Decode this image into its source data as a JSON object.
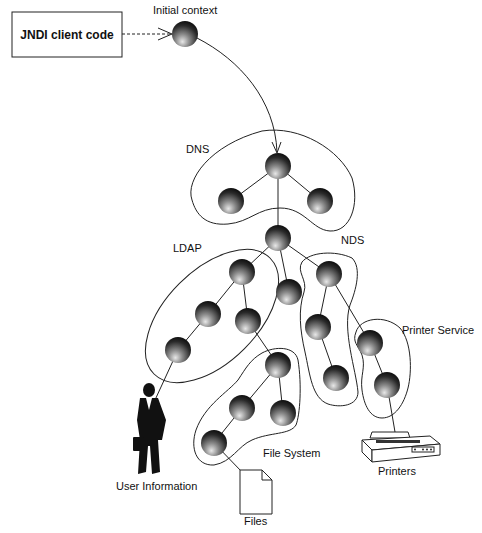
{
  "diagram": {
    "client_box": {
      "label": "JNDI client code"
    },
    "initial_context": {
      "label": "Initial context"
    },
    "namespaces": [
      {
        "id": "dns",
        "label": "DNS"
      },
      {
        "id": "ldap",
        "label": "LDAP"
      },
      {
        "id": "nds",
        "label": "NDS"
      },
      {
        "id": "printer-service",
        "label": "Printer Service"
      },
      {
        "id": "file-system",
        "label": "File System"
      }
    ],
    "resources": [
      {
        "id": "user-information",
        "label": "User Information",
        "icon": "person-icon"
      },
      {
        "id": "files",
        "label": "Files",
        "icon": "document-icon"
      },
      {
        "id": "printers",
        "label": "Printers",
        "icon": "printer-icon"
      }
    ],
    "nodes": [
      {
        "id": "ic",
        "x": 185,
        "y": 34
      },
      {
        "id": "dns-top",
        "x": 278,
        "y": 166
      },
      {
        "id": "dns-left",
        "x": 231,
        "y": 201
      },
      {
        "id": "dns-right",
        "x": 320,
        "y": 201
      },
      {
        "id": "root",
        "x": 278,
        "y": 238
      },
      {
        "id": "ldap-top",
        "x": 242,
        "y": 272
      },
      {
        "id": "ldap-midleft",
        "x": 208,
        "y": 314
      },
      {
        "id": "ldap-midright",
        "x": 248,
        "y": 321
      },
      {
        "id": "ldap-bottom",
        "x": 178,
        "y": 350
      },
      {
        "id": "mid",
        "x": 289,
        "y": 292
      },
      {
        "id": "nds-top",
        "x": 329,
        "y": 274
      },
      {
        "id": "nds-mid",
        "x": 318,
        "y": 327
      },
      {
        "id": "nds-bottom",
        "x": 336,
        "y": 378
      },
      {
        "id": "ps-top",
        "x": 370,
        "y": 343
      },
      {
        "id": "ps-bottom",
        "x": 387,
        "y": 385
      },
      {
        "id": "fs-top",
        "x": 278,
        "y": 365
      },
      {
        "id": "fs-midleft",
        "x": 242,
        "y": 408
      },
      {
        "id": "fs-midright",
        "x": 283,
        "y": 413
      },
      {
        "id": "fs-bottom",
        "x": 214,
        "y": 443
      }
    ]
  }
}
